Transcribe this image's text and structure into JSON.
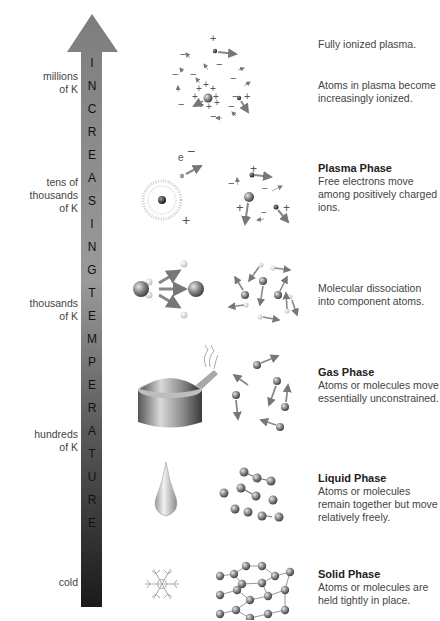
{
  "arrow": {
    "letters": [
      "I",
      "N",
      "C",
      "R",
      "E",
      "A",
      "S",
      "I",
      "N",
      "G",
      "T",
      "E",
      "M",
      "P",
      "E",
      "R",
      "A",
      "T",
      "U",
      "R",
      "E"
    ],
    "label": "INCREASING TEMPERATURE",
    "gradient_top": "#8a8a8a",
    "gradient_bottom": "#1c1c1c"
  },
  "temperature_labels": [
    {
      "line1": "millions",
      "line2": "of K"
    },
    {
      "line1": "tens of",
      "line2": "thousands",
      "line3": "of K"
    },
    {
      "line1": "thousands",
      "line2": "of K"
    },
    {
      "line1": "hundreds",
      "line2": "of K"
    },
    {
      "line1": "cold"
    }
  ],
  "rows": [
    {
      "id": "fully-ionized",
      "title": "",
      "text": "Fully ionized plasma."
    },
    {
      "id": "increasingly-ionized",
      "title": "",
      "text": "Atoms in plasma become increasingly ionized."
    },
    {
      "id": "plasma",
      "title": "Plasma Phase",
      "text": "Free electrons move among positively charged ions."
    },
    {
      "id": "dissociation",
      "title": "",
      "text": "Molecular dissociation into component atoms."
    },
    {
      "id": "gas",
      "title": "Gas Phase",
      "text": "Atoms or molecules move essentially unconstrained."
    },
    {
      "id": "liquid",
      "title": "Liquid Phase",
      "text": "Atoms or molecules remain together but move relatively freely."
    },
    {
      "id": "solid",
      "title": "Solid Phase",
      "text": "Atoms or molecules are held tightly in place."
    }
  ],
  "illustration_labels": {
    "electron": "e",
    "minus": "−",
    "plus": "+"
  }
}
